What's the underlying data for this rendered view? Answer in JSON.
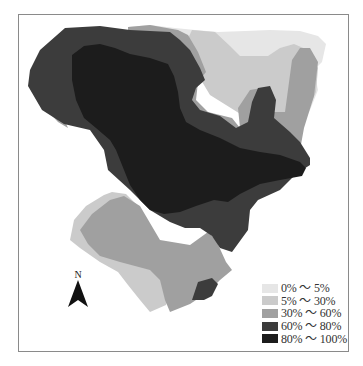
{
  "map": {
    "north_label": "N",
    "colors": {
      "class_0_5": "#e6e6e6",
      "class_5_30": "#cbcbcb",
      "class_30_60": "#a0a0a0",
      "class_60_80": "#3c3c3c",
      "class_80_100": "#1c1c1c"
    }
  },
  "legend": {
    "items": [
      {
        "label": "0% ～ 5%",
        "color": "#e6e6e6"
      },
      {
        "label": "5% ～ 30%",
        "color": "#cbcbcb"
      },
      {
        "label": "30% ～ 60%",
        "color": "#a0a0a0"
      },
      {
        "label": "60% ～ 80%",
        "color": "#3c3c3c"
      },
      {
        "label": "80% ～ 100%",
        "color": "#1c1c1c"
      }
    ]
  }
}
